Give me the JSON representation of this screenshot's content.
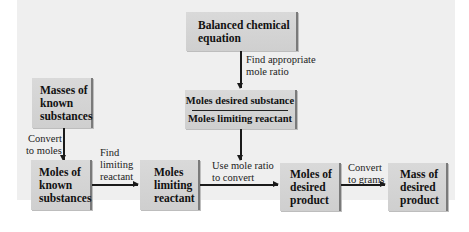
{
  "diagram": {
    "type": "flowchart",
    "boxes": {
      "balanced_equation": {
        "lines": [
          "Balanced chemical",
          "equation"
        ]
      },
      "mole_ratio": {
        "numerator": "Moles desired substance",
        "denominator": "Moles limiting reactant"
      },
      "masses_known": {
        "lines": [
          "Masses of",
          "known",
          "substances"
        ]
      },
      "moles_known": {
        "lines": [
          "Moles of",
          "known",
          "substances"
        ]
      },
      "moles_limiting": {
        "lines": [
          "Moles",
          "limiting",
          "reactant"
        ]
      },
      "moles_desired": {
        "lines": [
          "Moles of",
          "desired",
          "product"
        ]
      },
      "mass_desired": {
        "lines": [
          "Mass of",
          "desired",
          "product"
        ]
      }
    },
    "arrows": {
      "find_ratio": {
        "lines": [
          "Find appropriate",
          "mole ratio"
        ]
      },
      "convert_moles": {
        "lines": [
          "Convert",
          "to moles"
        ]
      },
      "find_limiting": {
        "lines": [
          "Find",
          "limiting",
          "reactant"
        ]
      },
      "use_ratio": {
        "lines": [
          "Use mole ratio",
          "to convert"
        ]
      },
      "convert_grams": {
        "lines": [
          "Convert",
          "to grams"
        ]
      }
    },
    "colors": {
      "panel_background": "#efefef",
      "box_fill": "#d4d4d4",
      "box_edge": "#7a7a7a",
      "arrow": "#1a1a1a"
    }
  }
}
